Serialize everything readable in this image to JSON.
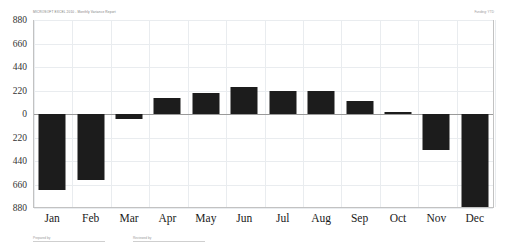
{
  "header": {
    "title": "MICROSOFT EXCEL 2010 - Monthly Variance Report",
    "right_note": "Funding: YTD"
  },
  "footer": {
    "items": [
      {
        "label": "Prepared by",
        "width": 72
      },
      {
        "label": "Reviewed by",
        "width": 72
      }
    ]
  },
  "chart_data": {
    "type": "bar",
    "title": "",
    "xlabel": "",
    "ylabel": "",
    "categories": [
      "Jan",
      "Feb",
      "Mar",
      "Apr",
      "May",
      "Jun",
      "Jul",
      "Aug",
      "Sep",
      "Oct",
      "Nov",
      "Dec"
    ],
    "values": [
      -710,
      -620,
      -45,
      150,
      200,
      250,
      215,
      215,
      120,
      15,
      -340,
      -875
    ],
    "ylim": [
      -880,
      880
    ],
    "yticks": [
      880,
      660,
      440,
      220,
      0,
      220,
      440,
      660,
      880
    ],
    "ytick_values": [
      880,
      660,
      440,
      220,
      0,
      -220,
      -440,
      -660,
      -880
    ],
    "grid": true,
    "legend": "none",
    "bar_color": "#1c1c1c",
    "grid_color": "#e9ecef",
    "axis_color": "#9a9a9a"
  }
}
